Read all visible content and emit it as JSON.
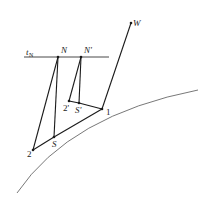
{
  "diagram": {
    "colors": {
      "line": "#1a1a1a",
      "curve": "#555555",
      "background": "#ffffff"
    },
    "tangent_line": {
      "label": "t",
      "subscript": "N"
    },
    "points": {
      "N": {
        "label": "N",
        "x": 58,
        "y": 57
      },
      "N_prime": {
        "label": "N'",
        "x": 81,
        "y": 57
      },
      "W": {
        "label": "W",
        "x": 131,
        "y": 23
      },
      "P1": {
        "label": "1",
        "x": 102,
        "y": 109
      },
      "P2_prime": {
        "label": "2'",
        "x": 69,
        "y": 101
      },
      "S_prime": {
        "label": "S'",
        "x": 79,
        "y": 103
      },
      "P2": {
        "label": "2",
        "x": 33,
        "y": 150
      },
      "S": {
        "label": "S",
        "x": 54,
        "y": 137
      }
    }
  }
}
